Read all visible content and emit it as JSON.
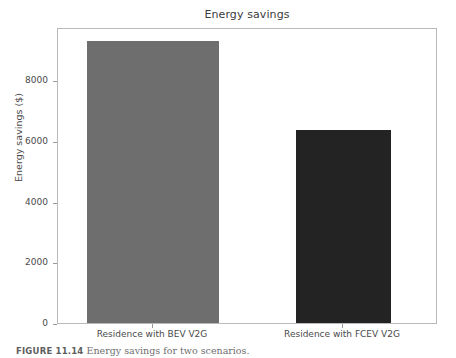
{
  "chart_data": {
    "type": "bar",
    "title": "Energy savings",
    "xlabel": "",
    "ylabel": "Energy savings ($)",
    "categories": [
      "Residence with BEV V2G",
      "Residence with FCEV V2G"
    ],
    "values": [
      9280,
      6350
    ],
    "ytick_labels": [
      "0",
      "2000",
      "4000",
      "6000",
      "8000"
    ],
    "ytick_values": [
      0,
      2000,
      4000,
      6000,
      8000
    ],
    "ylim": [
      0,
      9750
    ],
    "grid": false,
    "legend": null,
    "bar_colors": [
      "#6e6e6e",
      "#232323"
    ],
    "plot_background": "#ffffff",
    "axis_color": "#b9b9b9"
  },
  "caption": {
    "label": "FIGURE 11.14",
    "text": "Energy savings for two scenarios."
  }
}
